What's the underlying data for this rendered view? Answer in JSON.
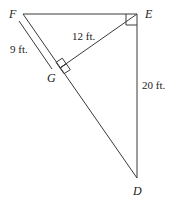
{
  "diagram": {
    "type": "right-triangle-with-altitude",
    "vertices": {
      "F": {
        "label": "F",
        "x": 23,
        "y": 14
      },
      "E": {
        "label": "E",
        "x": 137,
        "y": 14
      },
      "D": {
        "label": "D",
        "x": 137,
        "y": 178
      },
      "G": {
        "label": "G",
        "x": 60,
        "y": 68
      }
    },
    "segments": [
      {
        "from": "F",
        "to": "E"
      },
      {
        "from": "E",
        "to": "D"
      },
      {
        "from": "F",
        "to": "D"
      },
      {
        "from": "E",
        "to": "G"
      }
    ],
    "right_angles": [
      "E",
      "G"
    ],
    "measurements": {
      "FG": "9 ft.",
      "EG": "12 ft.",
      "ED": "20 ft."
    },
    "colors": {
      "line": "#3a3a3a",
      "text": "#222222",
      "background": "#ffffff"
    }
  }
}
